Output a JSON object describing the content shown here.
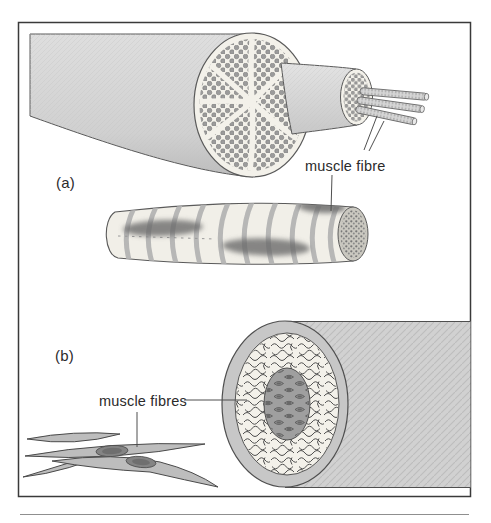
{
  "figure": {
    "panels": {
      "a": {
        "label": "(a)",
        "callout": "muscle fibre"
      },
      "b": {
        "label": "(b)",
        "callout": "muscle fibres"
      }
    }
  },
  "colors": {
    "frame_border": "#3a3a3a",
    "text_color": "#2b2b2b",
    "outline": "#4f4f4f",
    "cut_face": "#f3f1ea",
    "muscle_grey": "#cfcfcf",
    "dot_grey": "#9b9b9b",
    "nucleus_grey": "#6c6c6c",
    "underline_grey": "#8f8f8f"
  }
}
